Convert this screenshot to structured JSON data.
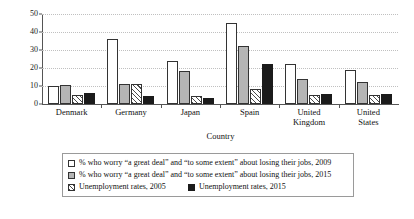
{
  "chart_data": {
    "type": "bar",
    "title": "",
    "xlabel": "Country",
    "ylabel": "Percent",
    "ylim": [
      0,
      50
    ],
    "yticks": [
      0,
      10,
      20,
      30,
      40,
      50
    ],
    "grid": true,
    "legend_position": "bottom",
    "categories": [
      "Denmark",
      "Germany",
      "Japan",
      "Spain",
      "United Kingdom",
      "United States"
    ],
    "series": [
      {
        "name": "% who worry “a great deal” and “to some extent” about losing their jobs, 2009",
        "swatch": "white-outline",
        "values": [
          10,
          36,
          24,
          45,
          22,
          19
        ]
      },
      {
        "name": "% who worry “a great deal” and “to some extent” about losing their jobs, 2015",
        "swatch": "gray",
        "values": [
          10.5,
          11,
          18.5,
          32,
          14,
          12.5
        ]
      },
      {
        "name": "Unemployment rates, 2005",
        "swatch": "hatched",
        "values": [
          4.8,
          11,
          4.4,
          8.5,
          4.8,
          5
        ]
      },
      {
        "name": "Unemployment rates, 2015",
        "swatch": "black",
        "values": [
          6,
          4.6,
          3.4,
          22,
          5.5,
          5.3
        ]
      }
    ]
  },
  "category_lines": [
    [
      "Denmark"
    ],
    [
      "Germany"
    ],
    [
      "Japan"
    ],
    [
      "Spain"
    ],
    [
      "United",
      "Kingdom"
    ],
    [
      "United",
      "States"
    ]
  ],
  "legend": {
    "row1": "% who worry “a great deal” and “to some extent” about losing their jobs, 2009",
    "row2": "% who worry “a great deal” and “to some extent” about losing their jobs, 2015",
    "row3a": "Unemployment rates, 2005",
    "row3b": "Unemployment rates, 2015"
  }
}
